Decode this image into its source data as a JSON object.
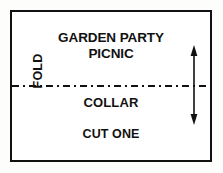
{
  "pattern": {
    "title_line_1": "GARDEN PARTY",
    "title_line_2": "PICNIC",
    "piece_name": "COLLAR",
    "cut_instruction": "CUT ONE",
    "fold_label": "FOLD",
    "grainline_icon": "double-headed-vertical-arrow",
    "fold_line_icon": "dash-dot-horizontal-line"
  },
  "colors": {
    "ink": "#111111",
    "paper": "#ffffff",
    "canvas": "#fdfdfb"
  }
}
